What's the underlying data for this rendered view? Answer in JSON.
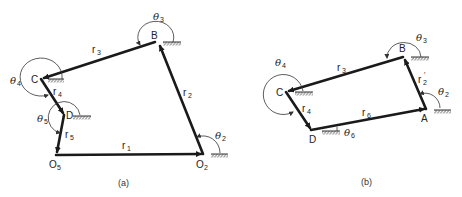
{
  "figure": {
    "panels": [
      {
        "id": "a",
        "caption": "(a)",
        "points": {
          "C": "C",
          "B": "B",
          "D": "D",
          "O5": "O",
          "O5_sub": "5",
          "O2": "O",
          "O2_sub": "2"
        },
        "links": {
          "r1": {
            "base": "r",
            "sub": "1"
          },
          "r2": {
            "base": "r",
            "sub": "2"
          },
          "r3": {
            "base": "r",
            "sub": "3"
          },
          "r4": {
            "base": "r",
            "sub": "4"
          },
          "r5": {
            "base": "r",
            "sub": "5"
          }
        },
        "angles": {
          "t2": {
            "base": "θ",
            "sub": "2"
          },
          "t3": {
            "base": "θ",
            "sub": "3"
          },
          "t4": {
            "base": "θ",
            "sub": "4"
          },
          "t5": {
            "base": "θ",
            "sub": "5"
          }
        }
      },
      {
        "id": "b",
        "caption": "(b)",
        "points": {
          "C": "C",
          "B": "B",
          "D": "D",
          "A": "A"
        },
        "links": {
          "r2p": {
            "base": "r",
            "sub": "2",
            "sup": "′"
          },
          "r3": {
            "base": "r",
            "sub": "3"
          },
          "r4": {
            "base": "r",
            "sub": "4"
          },
          "r6": {
            "base": "r",
            "sub": "6"
          }
        },
        "angles": {
          "t2": {
            "base": "θ",
            "sub": "2"
          },
          "t3": {
            "base": "θ",
            "sub": "3"
          },
          "t4": {
            "base": "θ",
            "sub": "4"
          },
          "t6": {
            "base": "θ",
            "sub": "6"
          }
        }
      }
    ]
  }
}
